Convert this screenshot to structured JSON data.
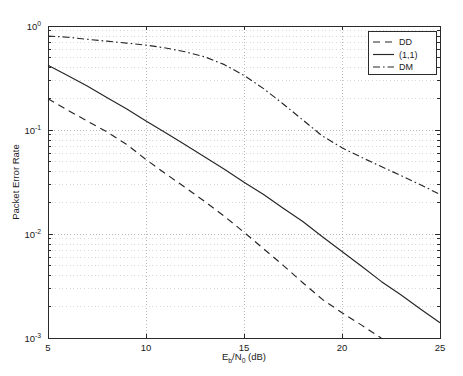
{
  "chart_data": {
    "type": "line",
    "title": "",
    "xlabel": "E_b/N_0 (dB)",
    "xlabel_parts": {
      "base1": "E",
      "sub1": "b",
      "slash": "/",
      "base2": "N",
      "sub2": "0",
      "unit": " (dB)"
    },
    "ylabel": "Packet Error Rate",
    "xlim": [
      5,
      25
    ],
    "ylim": [
      0.001,
      1
    ],
    "yscale": "log",
    "xscale": "linear",
    "grid": true,
    "grid_style": "dotted",
    "xticks": [
      5,
      10,
      15,
      20,
      25
    ],
    "xticklabels": [
      "5",
      "10",
      "15",
      "20",
      "25"
    ],
    "yticks": [
      1,
      0.1,
      0.01,
      0.001
    ],
    "yticklabels": [
      "10^0",
      "10^-1",
      "10^-2",
      "10^-3"
    ],
    "ytick_parts": [
      {
        "mantissa": "10",
        "exponent": "0"
      },
      {
        "mantissa": "10",
        "exponent": "-1"
      },
      {
        "mantissa": "10",
        "exponent": "-2"
      },
      {
        "mantissa": "10",
        "exponent": "-3"
      }
    ],
    "legend_position": "upper right",
    "series": [
      {
        "name": "DD",
        "style": "dashed",
        "color": "#262626",
        "x": [
          5,
          6,
          7,
          8,
          9,
          10,
          11,
          12,
          13,
          14,
          15,
          16,
          17,
          18,
          19,
          20,
          21,
          22
        ],
        "values": [
          0.2,
          0.155,
          0.122,
          0.096,
          0.073,
          0.052,
          0.038,
          0.028,
          0.0205,
          0.0148,
          0.0104,
          0.0072,
          0.005,
          0.0034,
          0.00235,
          0.00175,
          0.00133,
          0.001
        ]
      },
      {
        "name": "(1,1)",
        "style": "solid",
        "color": "#262626",
        "x": [
          5,
          6,
          7,
          8,
          9,
          10,
          11,
          12,
          13,
          14,
          15,
          16,
          17,
          18,
          19,
          20,
          21,
          22,
          23,
          24,
          25
        ],
        "values": [
          0.42,
          0.335,
          0.265,
          0.205,
          0.16,
          0.122,
          0.094,
          0.072,
          0.055,
          0.042,
          0.0315,
          0.024,
          0.0177,
          0.0132,
          0.0094,
          0.0068,
          0.0049,
          0.0035,
          0.0026,
          0.0019,
          0.0014
        ]
      },
      {
        "name": "DM",
        "style": "dashdot",
        "color": "#262626",
        "x": [
          5,
          6,
          7,
          8,
          9,
          10,
          11,
          12,
          13,
          14,
          15,
          16,
          17,
          18,
          19,
          20,
          21,
          22,
          23,
          24,
          25
        ],
        "values": [
          0.8,
          0.78,
          0.745,
          0.715,
          0.685,
          0.655,
          0.615,
          0.565,
          0.505,
          0.425,
          0.335,
          0.25,
          0.178,
          0.125,
          0.0875,
          0.0675,
          0.0545,
          0.0445,
          0.0365,
          0.0298,
          0.024
        ]
      }
    ]
  },
  "legend": {
    "entries": [
      {
        "label": "DD",
        "style": "dashed"
      },
      {
        "label": "(1,1)",
        "style": "solid"
      },
      {
        "label": "DM",
        "style": "dashdot"
      }
    ]
  },
  "axes": {
    "y_axis_title": "Packet Error Rate"
  }
}
